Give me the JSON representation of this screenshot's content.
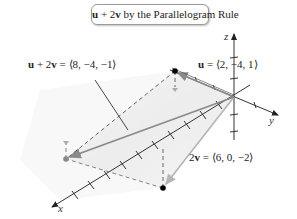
{
  "title": {
    "bold_u": "u",
    "middle": " + 2",
    "bold_v": "v",
    "rest": " by the Parallelogram Rule"
  },
  "labels": {
    "sum": {
      "bold_u": "u",
      "plus": " + 2",
      "bold_v": "v",
      "value": " = ⟨8, −4, −1⟩"
    },
    "u": {
      "bold_u": "u",
      "value": " = ⟨2, −4, 1⟩"
    },
    "two_v": {
      "prefix": "2",
      "bold_v": "v",
      "value": " = ⟨6, 0, −2⟩"
    }
  },
  "axes": {
    "x": "x",
    "y": "y",
    "z": "z"
  },
  "colors": {
    "axis": "#333333",
    "vector_u": "#8c8c8c",
    "vector_2v": "#b0b0b0",
    "vector_sum": "#8a8a8a",
    "shade": "#e6e6e6",
    "point": "#000000"
  },
  "vectors": [
    {
      "name": "u",
      "components": [
        2,
        -4,
        1
      ]
    },
    {
      "name": "2v",
      "components": [
        6,
        0,
        -2
      ]
    },
    {
      "name": "u + 2v",
      "components": [
        8,
        -4,
        -1
      ]
    }
  ]
}
